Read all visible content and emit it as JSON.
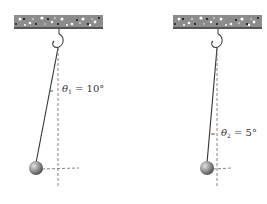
{
  "diagram": {
    "title": "",
    "pendulums": [
      {
        "id": "pendulum-1",
        "angle_symbol": "θ",
        "angle_subscript": "1",
        "angle_equals": " = ",
        "angle_value": "10°",
        "angle_degrees": 10
      },
      {
        "id": "pendulum-2",
        "angle_symbol": "θ",
        "angle_subscript": "2",
        "angle_equals": " = ",
        "angle_value": "5°",
        "angle_degrees": 5
      }
    ],
    "colors": {
      "ceiling": "#8c8c8c",
      "ceiling_edge": "#555555",
      "string": "#333333",
      "dashed_line": "#777777",
      "bob_light": "#d8d8d8",
      "bob_dark": "#5a5a5a"
    }
  }
}
